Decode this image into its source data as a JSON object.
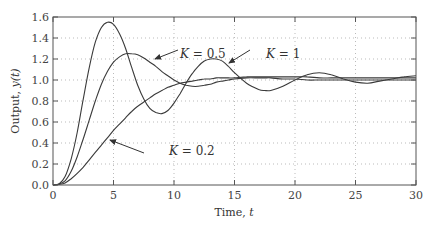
{
  "chart_data": {
    "type": "line",
    "title": "",
    "xlabel": "Time, t",
    "xlabel_parts": {
      "text": "Time, ",
      "var": "t"
    },
    "ylabel": "Output, y(t)",
    "ylabel_parts": {
      "text": "Output, ",
      "var": "y(t)"
    },
    "xlim": [
      0,
      30
    ],
    "ylim": [
      0,
      1.6
    ],
    "xticks": [
      0,
      5,
      10,
      15,
      20,
      25,
      30
    ],
    "xtick_labels": [
      "0",
      "5",
      "10",
      "15",
      "20",
      "25",
      "30"
    ],
    "yticks": [
      0,
      0.2,
      0.4,
      0.6,
      0.8,
      1.0,
      1.2,
      1.4,
      1.6
    ],
    "ytick_labels": [
      "0.0",
      "0.2",
      "0.4",
      "0.6",
      "0.8",
      "1.0",
      "1.2",
      "1.4",
      "1.6"
    ],
    "grid": true,
    "legend": "none (inline annotations)",
    "x": [
      0,
      0.5,
      1,
      1.5,
      2,
      2.5,
      3,
      3.5,
      4,
      4.5,
      5,
      5.5,
      6,
      6.5,
      7,
      7.5,
      8,
      8.5,
      9,
      9.5,
      10,
      10.5,
      11,
      11.5,
      12,
      12.5,
      13,
      13.5,
      14,
      14.5,
      15,
      16,
      17,
      17.5,
      18,
      19,
      20,
      21,
      22,
      23,
      24,
      25,
      26,
      27,
      28,
      29,
      30
    ],
    "series": [
      {
        "name": "K = 1",
        "values": [
          0,
          0.01,
          0.08,
          0.25,
          0.5,
          0.82,
          1.12,
          1.36,
          1.5,
          1.55,
          1.53,
          1.44,
          1.3,
          1.12,
          0.95,
          0.82,
          0.73,
          0.69,
          0.68,
          0.71,
          0.78,
          0.87,
          0.97,
          1.06,
          1.13,
          1.18,
          1.2,
          1.2,
          1.18,
          1.13,
          1.07,
          0.97,
          0.91,
          0.9,
          0.9,
          0.94,
          1.0,
          1.05,
          1.07,
          1.05,
          1.01,
          0.98,
          0.97,
          0.99,
          1.01,
          1.03,
          1.04
        ]
      },
      {
        "name": "K = 0.5",
        "values": [
          0,
          0.01,
          0.04,
          0.13,
          0.27,
          0.44,
          0.62,
          0.8,
          0.96,
          1.08,
          1.17,
          1.22,
          1.25,
          1.25,
          1.24,
          1.21,
          1.17,
          1.13,
          1.08,
          1.04,
          1.0,
          0.97,
          0.95,
          0.94,
          0.94,
          0.95,
          0.96,
          0.98,
          0.99,
          1.0,
          1.01,
          1.02,
          1.02,
          1.02,
          1.02,
          1.01,
          1.01,
          1.0,
          1.0,
          1.0,
          1.0,
          1.0,
          1.0,
          1.0,
          1.0,
          1.0,
          1.0
        ]
      },
      {
        "name": "K = 0.2",
        "values": [
          0,
          0.005,
          0.02,
          0.06,
          0.11,
          0.17,
          0.24,
          0.31,
          0.38,
          0.45,
          0.52,
          0.58,
          0.64,
          0.7,
          0.75,
          0.79,
          0.83,
          0.87,
          0.9,
          0.93,
          0.95,
          0.97,
          0.98,
          0.99,
          1.0,
          1.01,
          1.01,
          1.02,
          1.02,
          1.02,
          1.02,
          1.03,
          1.03,
          1.03,
          1.03,
          1.03,
          1.03,
          1.03,
          1.02,
          1.02,
          1.02,
          1.02,
          1.02,
          1.02,
          1.02,
          1.02,
          1.02
        ]
      }
    ],
    "annotations": [
      {
        "text": "K = 0.5",
        "label_pos": [
          158,
          60
        ],
        "arrow_tip": [
          155,
          59
        ],
        "arrow_tail": [
          178,
          50
        ]
      },
      {
        "text": "K = 1",
        "label_pos": [
          244,
          60
        ],
        "arrow_tip": [
          229,
          63
        ],
        "arrow_tail": [
          250,
          50
        ]
      },
      {
        "text": "K = 0.2",
        "label_pos": [
          147,
          157
        ],
        "arrow_tip": [
          110,
          140
        ],
        "arrow_tail": [
          144,
          153
        ]
      }
    ],
    "colors": {
      "curve": "#3a3a3a",
      "frame": "#555555",
      "grid": "#bbbbbb",
      "text": "#333333"
    }
  }
}
